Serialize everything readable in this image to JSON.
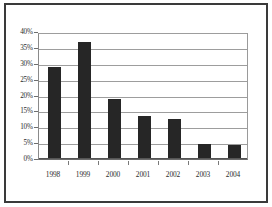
{
  "chart_data": {
    "type": "bar",
    "title": "",
    "subtitle": "",
    "xlabel": "",
    "ylabel": "",
    "categories": [
      "1998",
      "1999",
      "2000",
      "2001",
      "2002",
      "2003",
      "2004"
    ],
    "values": [
      29,
      37,
      19,
      13.7,
      12.6,
      4.6,
      4.5
    ],
    "series": [
      {
        "name": "",
        "values": [
          29,
          37,
          19,
          13.7,
          12.6,
          4.6,
          4.5
        ]
      }
    ],
    "ylim": [
      0,
      40
    ],
    "ytick_values": [
      0,
      5,
      10,
      15,
      20,
      25,
      30,
      35,
      40
    ],
    "ytick_labels": [
      "0%",
      "5%",
      "10%",
      "15%",
      "20%",
      "25%",
      "30%",
      "35%",
      "40%"
    ],
    "value_format": "percent",
    "grid": true,
    "grid_axis": "y",
    "legend": false,
    "legend_position": "none",
    "annotations": [],
    "colors": {
      "bar": "#262626",
      "gridline": "#9d9d9d",
      "axis": "#6a6a6a",
      "frame": "#3a3a3a",
      "background": "#ffffff",
      "text": "#2b2b2b"
    }
  }
}
